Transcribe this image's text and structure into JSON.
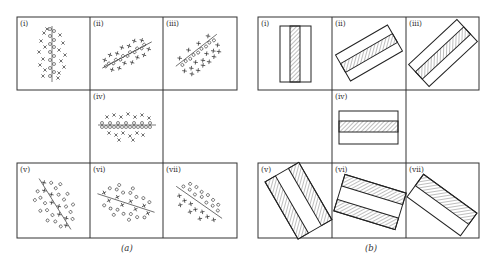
{
  "figure": {
    "panel_a": {
      "caption": "(a)",
      "cells": [
        {
          "label": "(i)",
          "markers": "crosses and circles",
          "axis": "vertical"
        },
        {
          "label": "(ii)",
          "markers": "crosses and circles",
          "axis": "oblique-up"
        },
        {
          "label": "(iii)",
          "markers": "crosses and circles",
          "axis": "oblique-up-steep"
        },
        {
          "label": "(iv)",
          "markers": "crosses and circles",
          "axis": "horizontal"
        },
        {
          "label": "(v)",
          "markers": "crosses and circles",
          "axis": "oblique-down-steep"
        },
        {
          "label": "(vi)",
          "markers": "crosses and circles",
          "axis": "oblique-down-shallow"
        },
        {
          "label": "(vii)",
          "markers": "crosses and circles",
          "axis": "oblique-down"
        }
      ]
    },
    "panel_b": {
      "caption": "(b)",
      "cells": [
        {
          "label": "(i)",
          "shape": "rectangle with central hatched band",
          "angle": 0
        },
        {
          "label": "(ii)",
          "shape": "rectangle with central hatched band",
          "angle": -30
        },
        {
          "label": "(iii)",
          "shape": "rectangle with central hatched band",
          "angle": -45
        },
        {
          "label": "(iv)",
          "shape": "rectangle with central hatched band",
          "angle": 0
        },
        {
          "label": "(v)",
          "shape": "rectangle with two hatched outer bands",
          "angle": -30
        },
        {
          "label": "(vi)",
          "shape": "rectangle with two hatched outer bands",
          "angle": 18
        },
        {
          "label": "(vii)",
          "shape": "rectangle with one hatched half",
          "angle": 35
        }
      ]
    }
  }
}
